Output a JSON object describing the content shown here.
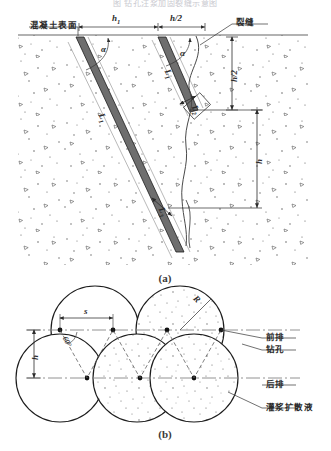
{
  "figure": {
    "top_caption": "图       钻孔注浆加固裂缝示意图",
    "sub_caption_a": "(a)",
    "sub_caption_b": "(b)",
    "colors": {
      "ink": "#2b2b2b",
      "line": "#555555",
      "concrete_fill": "#fdfdfd",
      "grout_fill": "#ffffff",
      "centerline": "#777777",
      "hole_dot": "#111111"
    }
  },
  "panel_a": {
    "labels": {
      "concrete_surface": "混凝土表面",
      "crack": "裂缝",
      "dim_h1": "h",
      "dim_h1_sub": "1",
      "dim_h_half_top": "h/2",
      "dim_h_half_right": "h/2",
      "dim_h_right": "h",
      "angle_alpha_left": "α",
      "angle_alpha_right": "α",
      "len_L1_long": "L",
      "len_L1_long_sub": "1",
      "len_L1_short": "L",
      "len_L1_short_sub": "1",
      "len_L2": "L",
      "len_L2_sub": "2",
      "len_L3": "L",
      "len_L3_sub": "3"
    }
  },
  "panel_b": {
    "labels": {
      "front_row": "前排",
      "drill_hole": "钻孔",
      "back_row": "后排",
      "grout_diffusion": "灌浆扩散液",
      "spacing_s": "s",
      "radius_R": "R",
      "depth_h": "h",
      "angle_60": "60°"
    },
    "geometry": {
      "circle_radius_px": 44,
      "front_row_y": 330,
      "back_row_y": 378,
      "front_centers_x": [
        95,
        180,
        265
      ],
      "back_centers_x": [
        60,
        137,
        194
      ]
    }
  }
}
